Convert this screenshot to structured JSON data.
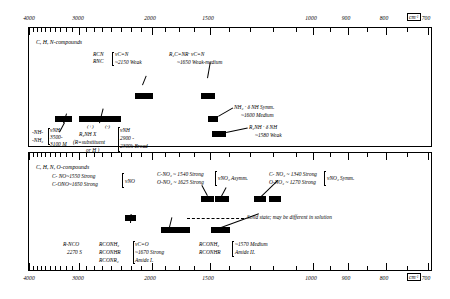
{
  "figure": {
    "axis": {
      "unit_label": "cm",
      "unit_exp": "-1",
      "major_ticks": [
        4000,
        3000,
        2000,
        1500,
        1000,
        900,
        800,
        700
      ],
      "tick_labels": [
        "4000",
        "3000",
        "2000",
        "1500",
        "1000",
        "900",
        "800",
        "700"
      ],
      "range_left": 4000,
      "range_right": 700
    },
    "panels": [
      {
        "id": "panel-1",
        "heading": "C, H, N-compounds",
        "bands": [
          {
            "name": "nitrile-isonitrile-band",
            "from": 2230,
            "to": 2120
          },
          {
            "name": "imine-CN-stretch-band",
            "from": 1690,
            "to": 1625
          },
          {
            "name": "NH2-delta-sym-band",
            "from": 1620,
            "to": 1585
          },
          {
            "name": "R2NH-delta-band",
            "from": 1600,
            "to": 1545
          },
          {
            "name": "NH-stretch-band",
            "from": 3520,
            "to": 3400
          },
          {
            "name": "NH-stretch-broad-band",
            "from": 3280,
            "to": 2880
          }
        ],
        "labels": {
          "nitrile": {
            "species_1": "RCN",
            "species_2": "RNC",
            "assignment": "νC≡N",
            "value": "~2150 Weak"
          },
          "imine": {
            "species": "R₂C=NR·",
            "assignment": "νC=N",
            "value": "~1650 Weak-medium"
          },
          "nh2_bend": {
            "species": "NH₂ · δ NH Symm.",
            "value": "~1600 Medium"
          },
          "r2nh_bend": {
            "species": "R₂NH · δ NH",
            "value": "~1580 Weak"
          },
          "nh_stretch": {
            "species_1": "-NH-",
            "species_2": "-NH₂",
            "assignment": "νNH",
            "value_1": "3500-",
            "value_2": "3100 M"
          },
          "ammonium": {
            "species": "R₃NH X",
            "charge_plus": "(+)",
            "charge_minus": "(-)",
            "note_1": "(R=substituent",
            "note_2": "or H )",
            "assignment": "νNH",
            "value_1": "2900 -",
            "value_2": "2300k Broad"
          }
        }
      },
      {
        "id": "panel-2",
        "heading": "C, H, N, O-compounds",
        "bands": [
          {
            "name": "nitroso-nitrite-band",
            "from": 1680,
            "to": 1620
          },
          {
            "name": "nitro-asym-band",
            "from": 1575,
            "to": 1520
          },
          {
            "name": "nitro-sym-band-1",
            "from": 1360,
            "to": 1320
          },
          {
            "name": "nitro-sym-band-2",
            "from": 1290,
            "to": 1250
          },
          {
            "name": "isocyanate-band",
            "from": 2310,
            "to": 2240
          },
          {
            "name": "amide-I-band",
            "from": 1700,
            "to": 1630
          },
          {
            "name": "amide-II-band",
            "from": 1590,
            "to": 1540
          }
        ],
        "labels": {
          "nitroso": {
            "species_1": "C- NO~1550 Strong",
            "species_2": "C-ONO~1650 Strong",
            "assignment": "νNO"
          },
          "nitro_asym": {
            "species_1": "C-NO₂ ~ 1540 Strong",
            "species_2": "O-NO₂ ~ 1625 Strong",
            "assignment": "νNO₂ Asymm."
          },
          "nitro_sym": {
            "species_1": "C- NO₂ ~ 1340 Strong",
            "species_2": "O-NO₂ ~ 1270 Strong",
            "assignment": "νNO₂ Symm."
          },
          "solid_state_note": "Solid state; may be different in solution",
          "isocyanate": {
            "species": "R-NCO",
            "value": "2270 S"
          },
          "amide_I": {
            "species_1": "RCONH₂",
            "species_2": "RCONHR",
            "species_3": "RCONR₂",
            "assignment": "νC=O",
            "value": "~1670 Strong",
            "name": "Amide I."
          },
          "amide_II": {
            "species_1": "RCONH₂",
            "species_2": "RCONHR",
            "value": "~1570 Medium",
            "name": "Amide II."
          }
        }
      }
    ]
  }
}
